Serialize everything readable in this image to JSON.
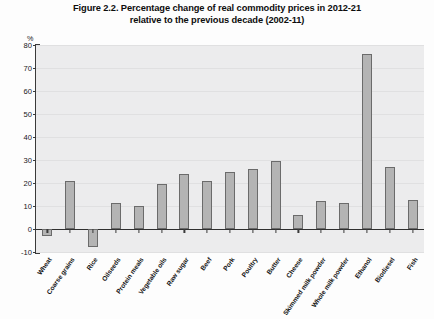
{
  "figure": {
    "title_line1": "Figure 2.2. Percentage change of real commodity prices in 2012-21",
    "title_line2": "relative to the previous decade (2002-11)",
    "y_unit": "%"
  },
  "chart_data": {
    "type": "bar",
    "title": "Figure 2.2. Percentage change of real commodity prices in 2012-21 relative to the previous decade (2002-11)",
    "xlabel": "",
    "ylabel": "%",
    "ylim": [
      -10,
      80
    ],
    "yticks": [
      -10,
      0,
      10,
      20,
      30,
      40,
      50,
      60,
      70,
      80
    ],
    "grid": true,
    "legend": null,
    "bar_color": "#b4b4b4",
    "bar_edge_color": "#6b6b6b",
    "plot_background": "#ececed",
    "categories": [
      "Wheat",
      "Coarse grains",
      "Rice",
      "Oilseeds",
      "Protein meals",
      "Vegetable oils",
      "Raw sugar",
      "Beef",
      "Pork",
      "Poultry",
      "Butter",
      "Cheese",
      "Skimmed milk powder",
      "Whole milk powder",
      "Ethanol",
      "Biodiesel",
      "Fish"
    ],
    "values": [
      -3,
      21,
      -8,
      11.5,
      10,
      19.5,
      24,
      21,
      25,
      26,
      29.5,
      6,
      12,
      11.5,
      76,
      27,
      12.5
    ]
  },
  "source_note": ""
}
